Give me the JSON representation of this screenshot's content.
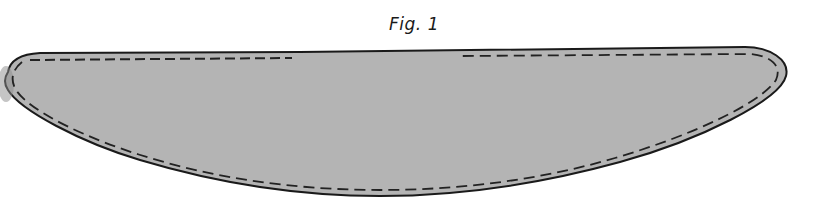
{
  "figure": {
    "caption": "Fig. 1",
    "shape": "pattern-piece-crescent",
    "fill_color": "#b4b4b4",
    "outline_color": "#1a1a1a",
    "stitch_line_color": "#222222",
    "stitch_line_style": "dashed"
  }
}
